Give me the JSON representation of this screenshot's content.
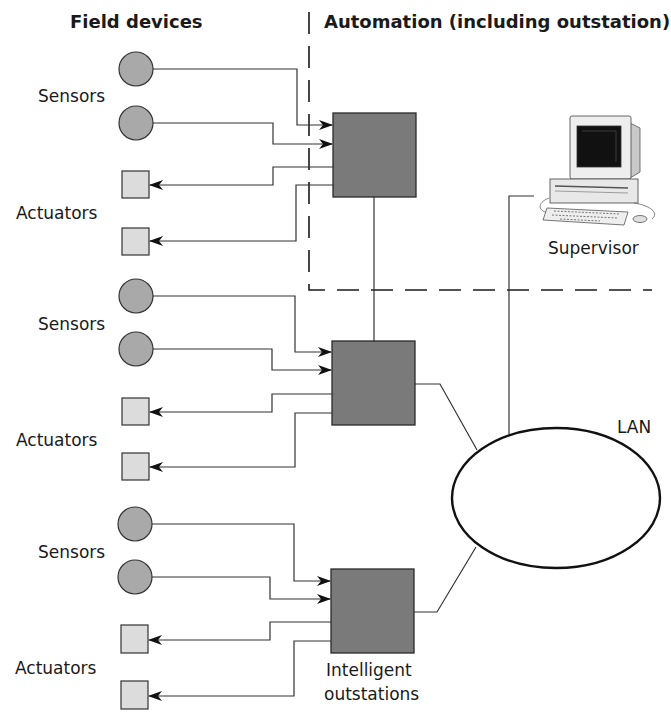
{
  "headers": {
    "left": "Field devices",
    "right": "Automation (including outstation)"
  },
  "groups": [
    {
      "sensors_label": "Sensors",
      "actuators_label": "Actuators"
    },
    {
      "sensors_label": "Sensors",
      "actuators_label": "Actuators"
    },
    {
      "sensors_label": "Sensors",
      "actuators_label": "Actuators"
    }
  ],
  "outstations": {
    "label_line1": "Intelligent",
    "label_line2": "outstations"
  },
  "supervisor": {
    "label": "Supervisor",
    "icon": "computer-workstation-icon"
  },
  "network": {
    "label": "LAN"
  },
  "colors": {
    "outstation_fill": "#7a7a7a",
    "sensor_fill": "#a9a9a9",
    "actuator_fill": "#dcdcdc",
    "line": "#333333"
  }
}
